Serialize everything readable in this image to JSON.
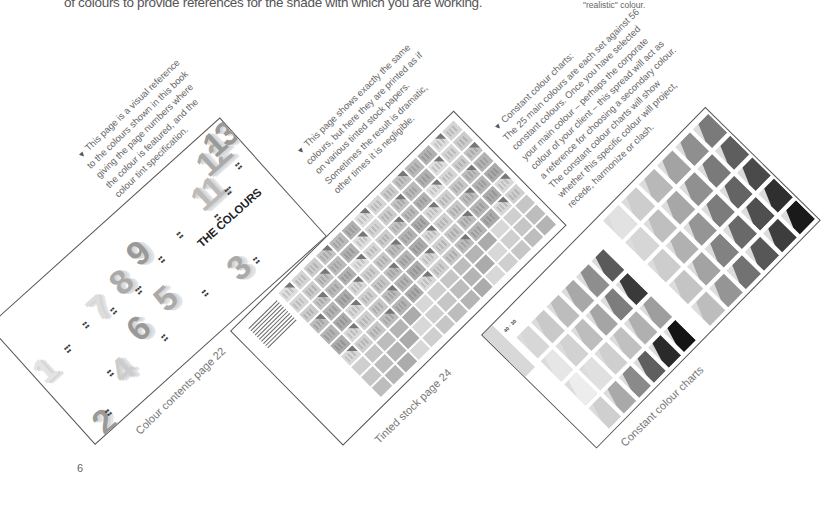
{
  "header": {
    "caption": "of colours to provide references for the shade with which you are working.",
    "right_caption": "\"realistic\" colour."
  },
  "folio": "6",
  "annotations": [
    {
      "id": "colour-contents",
      "bullet": "▼",
      "lines": [
        "This page is a visual reference",
        "to the colours shown in this book",
        "giving the page numbers where",
        "the colour is featured, and the",
        "colour tint specification."
      ]
    },
    {
      "id": "tinted-stock",
      "bullet": "▼",
      "lines": [
        "This page shows exactly the same",
        "colours, but here they are printed as if",
        "on various tinted stock papers.",
        "Sometimes the result is dramatic,",
        "other times it is negligible."
      ]
    },
    {
      "id": "constant-colour",
      "bullet": "▼",
      "lines": [
        "Constant colour charts:",
        "The 25 main colours are each set against 56",
        "constant colours. Once you have selected",
        "your main colour – perhaps the corporate",
        "colour of your client – this spread will act as",
        "a reference for choosing a secondary colour.",
        "The constant colour charts will show",
        "whether this specific colour will project,",
        "recede, harmonize or clash."
      ]
    }
  ],
  "pages": [
    {
      "id": "colour-contents-page",
      "title": "THE COLOURS",
      "caption": "Colour contents page 22",
      "big_numbers": [
        "11",
        "12",
        "13",
        "9",
        "8",
        "7",
        "6",
        "5",
        "4",
        "3",
        "2",
        "1"
      ]
    },
    {
      "id": "tinted-stock-page",
      "caption": "Tinted stock page 24",
      "grid": {
        "rows": 10,
        "cols": 14
      }
    },
    {
      "id": "constant-colour-page",
      "caption": "Constant colour charts",
      "header_label": "40 · 30",
      "left_grid": {
        "cols": 4,
        "rows": 6,
        "shades": [
          [
            "#d7d7d7",
            "#c9c9c9",
            "#bdbdbd",
            "#a8a8a8",
            "#8e8e8e",
            "#5a5a5a"
          ],
          [
            "#e6e6e6",
            "#d2d2d2",
            "#bdbdbd",
            "#a5a5a5",
            "#7d7d7d",
            "#3a3a3a"
          ],
          [
            "#ededed",
            "#e0e0e0",
            "#cfcfcf",
            "#c0c0c0",
            "#b0b0b0",
            "#9e9e9e"
          ],
          [
            "#cfcfcf",
            "#a9a9a9",
            "#8a8a8a",
            "#5f5f5f",
            "#2a2a2a",
            "#141414"
          ]
        ]
      },
      "right_grid": {
        "cols": 5,
        "rows": 6,
        "shades": [
          [
            "#e2e2e2",
            "#cdcdcd",
            "#b8b8b8",
            "#a3a3a3",
            "#8f8f8f",
            "#7a7a7a"
          ],
          [
            "#d6d6d6",
            "#bfbfbf",
            "#a7a7a7",
            "#909090",
            "#7a7a7a",
            "#5e5e5e"
          ],
          [
            "#cdcdcd",
            "#b1b1b1",
            "#959595",
            "#7c7c7c",
            "#646464",
            "#4a4a4a"
          ],
          [
            "#c4c4c4",
            "#a3a3a3",
            "#828282",
            "#696969",
            "#4f4f4f",
            "#2f2f2f"
          ],
          [
            "#bdbdbd",
            "#959595",
            "#727272",
            "#575757",
            "#3d3d3d",
            "#1a1a1a"
          ]
        ]
      }
    }
  ]
}
